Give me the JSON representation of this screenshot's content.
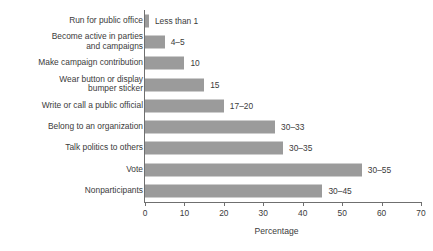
{
  "chart_data": {
    "type": "bar",
    "orientation": "horizontal",
    "title": "",
    "subtitle": "",
    "xlabel": "Percentage",
    "ylabel": "",
    "xlim": [
      0,
      70
    ],
    "xticks": [
      0,
      10,
      20,
      30,
      40,
      50,
      60,
      70
    ],
    "xtick_labels": [
      "0",
      "10",
      "20",
      "30",
      "40",
      "50",
      "60",
      "70"
    ],
    "grid": false,
    "legend": null,
    "bar_color": "#9b9b9b",
    "axis_color": "#6f6f6f",
    "text_color": "#3b3b3b",
    "categories": [
      "Run for public office",
      "Become active in parties\nand campaigns",
      "Make campaign contribution",
      "Wear button or display\nbumper sticker",
      "Write or call a public official",
      "Belong to an organization",
      "Talk politics to others",
      "Vote",
      "Nonparticipants"
    ],
    "values": [
      1,
      5,
      10,
      15,
      20,
      33,
      35,
      55,
      45
    ],
    "data_labels": [
      "Less than 1",
      "4–5",
      "10",
      "15",
      "17–20",
      "30–33",
      "30–35",
      "30–55",
      "30–45"
    ],
    "bars": [
      {
        "category": "Run for public office",
        "value": 1,
        "label": "Less than 1"
      },
      {
        "category": "Become active in parties\nand campaigns",
        "value": 5,
        "label": "4–5"
      },
      {
        "category": "Make campaign contribution",
        "value": 10,
        "label": "10"
      },
      {
        "category": "Wear button or display\nbumper sticker",
        "value": 15,
        "label": "15"
      },
      {
        "category": "Write or call a public official",
        "value": 20,
        "label": "17–20"
      },
      {
        "category": "Belong to an organization",
        "value": 33,
        "label": "30–33"
      },
      {
        "category": "Talk politics to others",
        "value": 35,
        "label": "30–35"
      },
      {
        "category": "Vote",
        "value": 55,
        "label": "30–55"
      },
      {
        "category": "Nonparticipants",
        "value": 45,
        "label": "30–45"
      }
    ]
  }
}
